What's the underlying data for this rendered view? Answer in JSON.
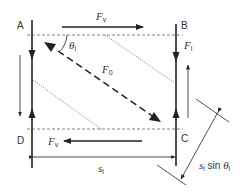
{
  "diagram": {
    "corners": {
      "a": "A",
      "b": "B",
      "c": "C",
      "d": "D"
    },
    "forces": {
      "fv_top": {
        "symbol": "F",
        "subscript": "v"
      },
      "fv_bottom": {
        "symbol": "F",
        "subscript": "v"
      },
      "fl": {
        "symbol": "F",
        "subscript": "l"
      },
      "f0": {
        "symbol": "F",
        "subscript": "0"
      }
    },
    "angle": {
      "symbol": "θ",
      "subscript": "l"
    },
    "dimensions": {
      "width": {
        "symbol": "s",
        "subscript": "l"
      },
      "slant": {
        "prefix": "s",
        "subscript": "l",
        "text": " sin ",
        "angle_symbol": "θ",
        "angle_subscript": "l"
      }
    },
    "colors": {
      "line": "#222222",
      "dashed": "#666666",
      "dotted": "#555555",
      "text": "#333333"
    }
  }
}
